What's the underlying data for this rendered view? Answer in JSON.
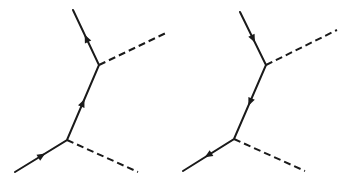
{
  "diagrams": [
    {
      "id": "left",
      "description": "Feynman diagram: fermion line with arrows pointing upward (particle), two dashed boson lines",
      "fermion_path": [
        [
          15,
          172
        ],
        [
          67,
          140
        ],
        [
          99,
          65
        ],
        [
          73,
          10
        ]
      ],
      "bosons": [
        {
          "from": [
            67,
            140
          ],
          "to": [
            138,
            172
          ]
        },
        {
          "from": [
            99,
            65
          ],
          "to": [
            168,
            32
          ]
        }
      ],
      "arrows": [
        {
          "at": [
            42,
            156
          ],
          "direction": "forward"
        },
        {
          "at": [
            83,
            103
          ],
          "direction": "forward"
        },
        {
          "at": [
            87,
            38
          ],
          "direction": "forward"
        }
      ],
      "color": "#1a1a1a"
    },
    {
      "id": "right",
      "description": "Feynman diagram: fermion line with arrows pointing downward (antiparticle), two dashed boson lines",
      "fermion_path": [
        [
          240,
          12
        ],
        [
          266,
          65
        ],
        [
          234,
          139
        ],
        [
          183,
          171
        ]
      ],
      "bosons": [
        {
          "from": [
            234,
            139
          ],
          "to": [
            305,
            171
          ]
        },
        {
          "from": [
            266,
            65
          ],
          "to": [
            337,
            30
          ]
        }
      ],
      "arrows": [
        {
          "at": [
            253,
            39
          ],
          "direction": "forward"
        },
        {
          "at": [
            250,
            102
          ],
          "direction": "forward"
        },
        {
          "at": [
            208,
            155
          ],
          "direction": "forward"
        }
      ],
      "color": "#1a1a1a"
    }
  ]
}
